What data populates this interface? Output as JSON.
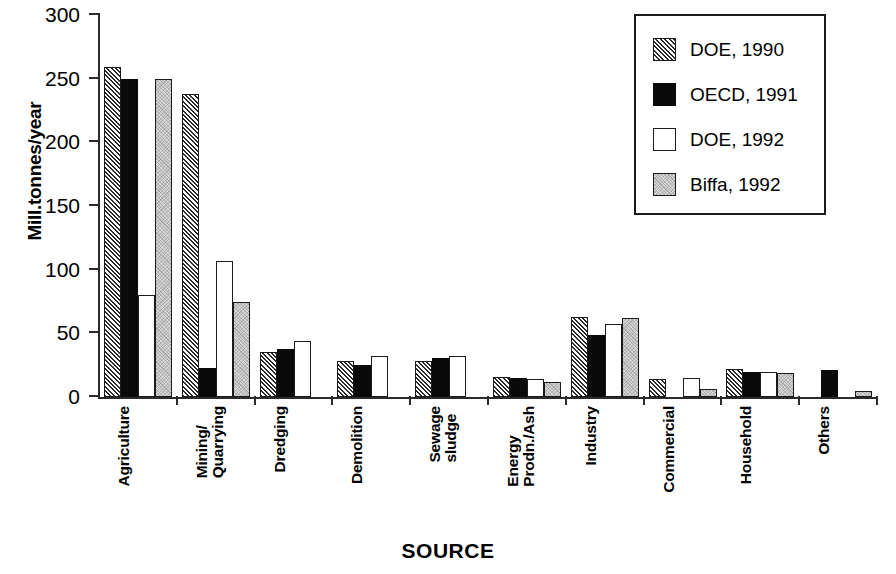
{
  "chart_data": {
    "type": "bar",
    "title": "",
    "xlabel": "SOURCE",
    "ylabel": "Mill.tonnes/year",
    "ylim": [
      0,
      300
    ],
    "yticks": [
      0,
      50,
      100,
      150,
      200,
      250,
      300
    ],
    "grid": false,
    "legend_position": "top-right",
    "categories": [
      "Agriculture",
      "Mining/\nQuarrying",
      "Dredging",
      "Demolition",
      "Sewage\nsludge",
      "Energy\nProdn./Ash",
      "Industry",
      "Commercial",
      "Household",
      "Others"
    ],
    "series": [
      {
        "name": "DOE, 1990",
        "fill": "hatch",
        "values": [
          259,
          238,
          35,
          28,
          28,
          16,
          63,
          14,
          22,
          null
        ]
      },
      {
        "name": "OECD, 1991",
        "fill": "black",
        "values": [
          250,
          23,
          38,
          25,
          31,
          15,
          49,
          null,
          20,
          21
        ]
      },
      {
        "name": "DOE, 1992",
        "fill": "white",
        "values": [
          80,
          107,
          44,
          32,
          32,
          14,
          57,
          15,
          20,
          null
        ]
      },
      {
        "name": "Biffa, 1992",
        "fill": "gray",
        "values": [
          250,
          75,
          null,
          null,
          null,
          12,
          62,
          6,
          19,
          5
        ]
      }
    ]
  },
  "legend": {
    "items": [
      {
        "label": "DOE, 1990",
        "fill": "hatch"
      },
      {
        "label": "OECD, 1991",
        "fill": "black"
      },
      {
        "label": "DOE, 1992",
        "fill": "white"
      },
      {
        "label": "Biffa, 1992",
        "fill": "gray"
      }
    ]
  },
  "colors": {
    "axis": "#2b2b2b",
    "black_series": "#0a0a0a",
    "gray_series": "#d6d6d6",
    "white_series": "#ffffff",
    "text": "#000000"
  }
}
